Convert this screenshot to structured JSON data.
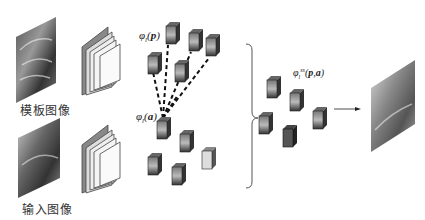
{
  "diagram": {
    "template_image": {
      "caption": "模板图像",
      "icon": "starry-night-image"
    },
    "input_image": {
      "caption": "输入图像",
      "icon": "street-scene-image"
    },
    "encoder_icon": "cnn-layer-stack",
    "labels": {
      "phi_p": "φl(p)",
      "phi_a": "φl(a)",
      "phi_pa": "φlss(p,a)"
    },
    "output_image": {
      "icon": "stylized-output-image"
    },
    "colors": {
      "background": "#ffffff",
      "cube_dark": "#333333",
      "cube_light": "#bbbbbb",
      "line": "#111111"
    }
  }
}
